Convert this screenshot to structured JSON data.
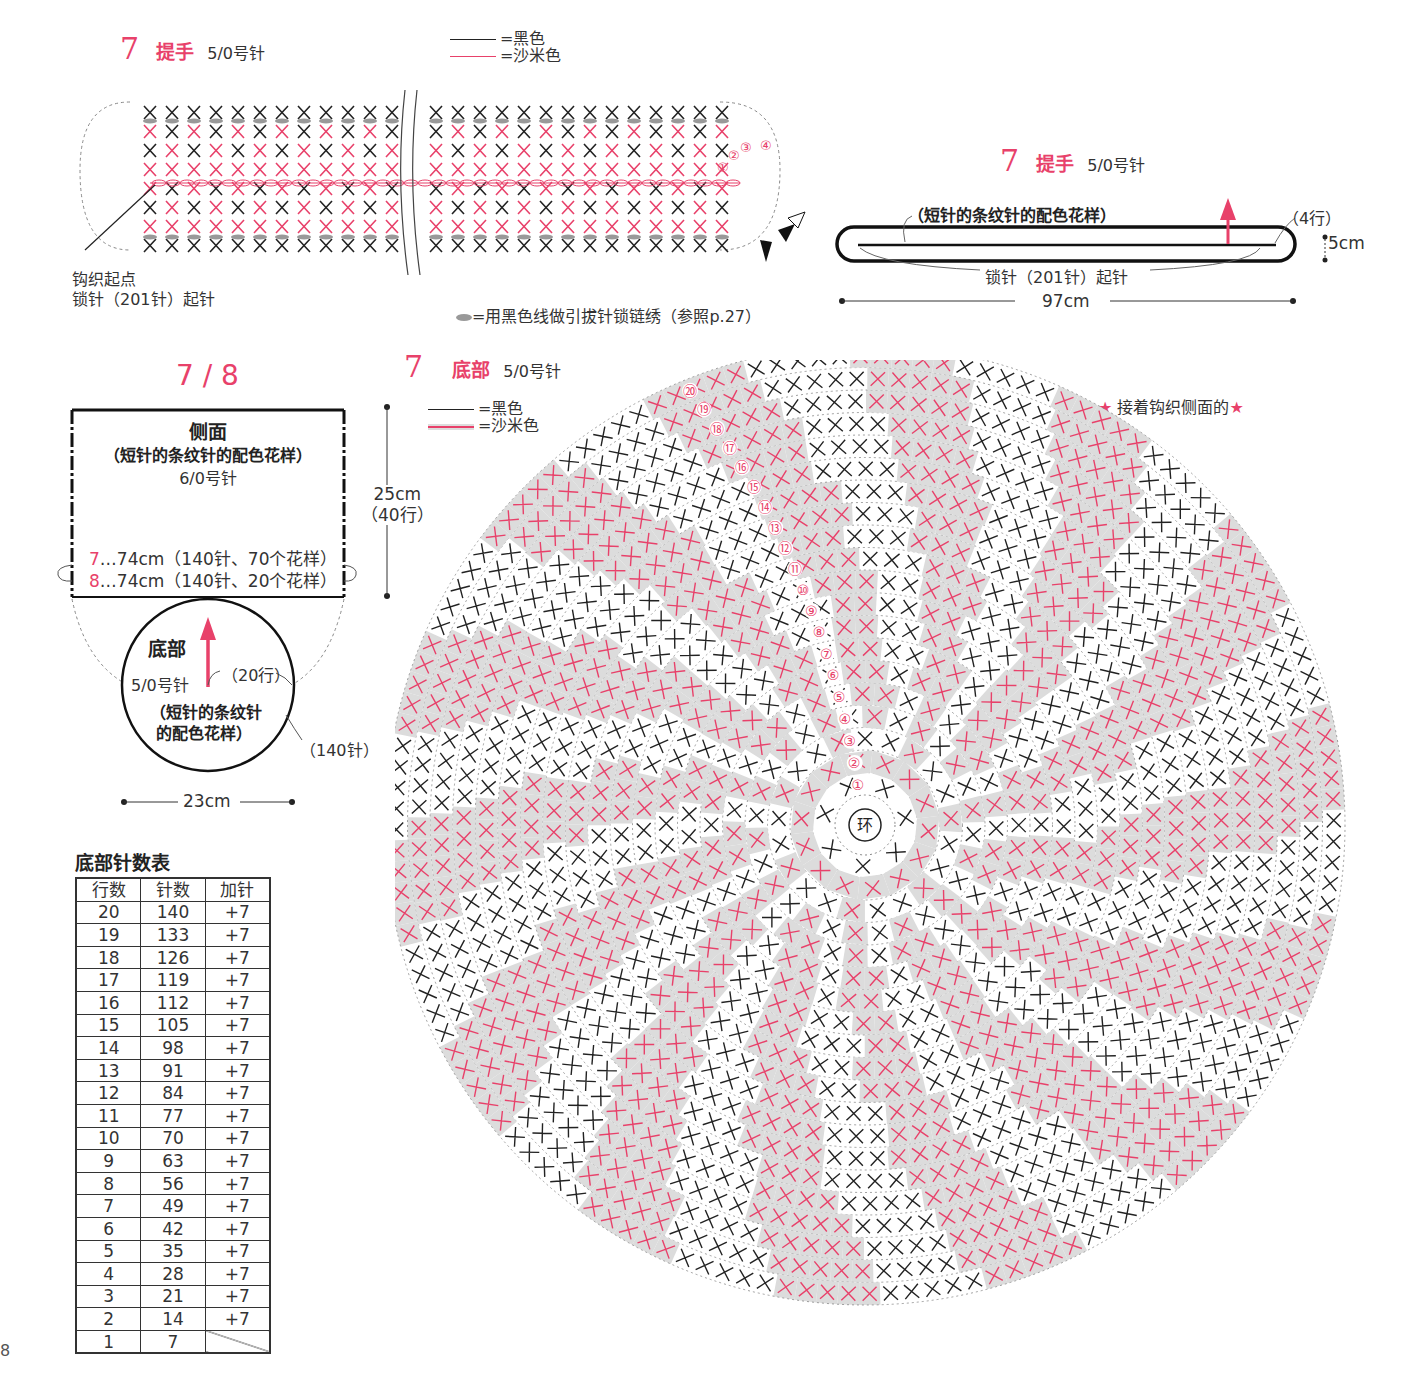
{
  "handle_chart": {
    "number": "7",
    "title": "提手",
    "needle": "5/0号针",
    "legend": [
      {
        "label": "=黑色",
        "color": "#222222"
      },
      {
        "label": "=沙米色",
        "color": "#e8416a"
      }
    ],
    "start_label": "钩织起点",
    "chain_label": "锁针（201针）起针",
    "note": "=用黑色线做引拔针锁链绣（参照p.27）",
    "row_marks": [
      "①",
      "②",
      "③",
      "④"
    ]
  },
  "handle_schematic": {
    "number": "7",
    "title": "提手",
    "needle": "5/0号针",
    "pattern_label": "（短针的条纹针的配色花样）",
    "rows_label": "（4行）",
    "height_label": "5cm",
    "chain_label": "锁针（201针）起针",
    "width_label": "97cm"
  },
  "side_schematic": {
    "number": "7 / 8",
    "title": "侧面",
    "pattern_label": "（短针的条纹针的配色花样）",
    "needle": "6/0号针",
    "height_label": "25cm",
    "rows_label": "（40行）",
    "line7_num": "7",
    "line7_text": "…74cm（140针、70个花样）",
    "line8_num": "8",
    "line8_text": "…74cm（140针、20个花样）",
    "bottom_title": "底部",
    "bottom_needle": "5/0号针",
    "bottom_rows": "（20行）",
    "bottom_pattern_1": "（短针的条纹针",
    "bottom_pattern_2": "的配色花样）",
    "bottom_stitches": "（140针）",
    "bottom_width": "23cm"
  },
  "bottom_chart": {
    "number": "7",
    "title": "底部",
    "needle": "5/0号针",
    "legend": [
      {
        "label": "=黑色",
        "color": "#222222"
      },
      {
        "label": "=沙米色",
        "color": "#e8416a"
      }
    ],
    "center_label": "环",
    "continue_note": "接着钩织侧面的",
    "star": "★",
    "rounds": 20,
    "colors": {
      "pink": "#e8416a",
      "black": "#222222",
      "shade": "#dcdcdc",
      "dash": "#888888"
    }
  },
  "count_table": {
    "title": "底部针数表",
    "headers": [
      "行数",
      "针数",
      "加针"
    ],
    "rows": [
      [
        "20",
        "140",
        "+7"
      ],
      [
        "19",
        "133",
        "+7"
      ],
      [
        "18",
        "126",
        "+7"
      ],
      [
        "17",
        "119",
        "+7"
      ],
      [
        "16",
        "112",
        "+7"
      ],
      [
        "15",
        "105",
        "+7"
      ],
      [
        "14",
        "98",
        "+7"
      ],
      [
        "13",
        "91",
        "+7"
      ],
      [
        "12",
        "84",
        "+7"
      ],
      [
        "11",
        "77",
        "+7"
      ],
      [
        "10",
        "70",
        "+7"
      ],
      [
        "9",
        "63",
        "+7"
      ],
      [
        "8",
        "56",
        "+7"
      ],
      [
        "7",
        "49",
        "+7"
      ],
      [
        "6",
        "42",
        "+7"
      ],
      [
        "5",
        "35",
        "+7"
      ],
      [
        "4",
        "28",
        "+7"
      ],
      [
        "3",
        "21",
        "+7"
      ],
      [
        "2",
        "14",
        "+7"
      ],
      [
        "1",
        "7",
        ""
      ]
    ]
  },
  "page_number": "8"
}
